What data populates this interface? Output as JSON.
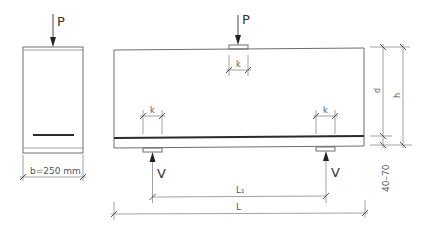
{
  "diagram": {
    "type": "reinforced concrete beam test setup",
    "cross_section": {
      "load_label": "P",
      "width_label": "b=250 mm"
    },
    "elevation": {
      "load_label": "P",
      "reaction_left_label": "V",
      "reaction_right_label": "V",
      "plate_width_label_top": "k",
      "plate_width_label_left": "k",
      "plate_width_label_right": "k",
      "effective_depth_label": "d",
      "height_label": "h",
      "cover_label": "40–70",
      "span_label": "L₁",
      "total_length_label": "L"
    },
    "colors": {
      "line": "#8a8a8a",
      "rebar": "#2a2a2a",
      "text": "#333333"
    }
  }
}
